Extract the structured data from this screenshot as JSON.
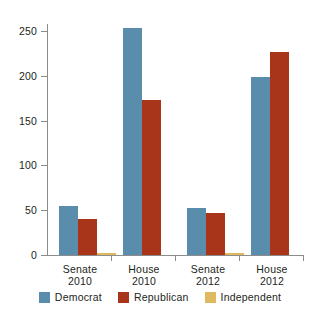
{
  "chart_data": {
    "type": "bar",
    "title": "",
    "subtitle": "",
    "xlabel": "",
    "ylabel": "",
    "categories": [
      "Senate\n2010",
      "House\n2010",
      "Senate\n2012",
      "House\n2012"
    ],
    "category_lines": [
      {
        "line1": "Senate",
        "line2": "2010"
      },
      {
        "line1": "House",
        "line2": "2010"
      },
      {
        "line1": "Senate",
        "line2": "2012"
      },
      {
        "line1": "House",
        "line2": "2012"
      }
    ],
    "series": [
      {
        "name": "Democrat",
        "color": "#5a8cab",
        "values": [
          55,
          255,
          53,
          200
        ]
      },
      {
        "name": "Republican",
        "color": "#a83519",
        "values": [
          41,
          174,
          47,
          228
        ]
      },
      {
        "name": "Independent",
        "color": "#dfb95f",
        "values": [
          2,
          0,
          2,
          0
        ]
      }
    ],
    "ylim": [
      0,
      260
    ],
    "yticks": [
      0,
      50,
      100,
      150,
      200,
      250
    ],
    "ytick_labels": [
      "0",
      "50",
      "100",
      "150",
      "200",
      "250"
    ],
    "grid": false,
    "legend_position": "bottom",
    "legend": [
      {
        "label": "Democrat",
        "color": "#5a8cab"
      },
      {
        "label": "Republican",
        "color": "#a83519"
      },
      {
        "label": "Independent",
        "color": "#dfb95f"
      }
    ],
    "axis_color": "#8c8c8c",
    "text_color": "#231f20",
    "background": "#ffffff"
  }
}
